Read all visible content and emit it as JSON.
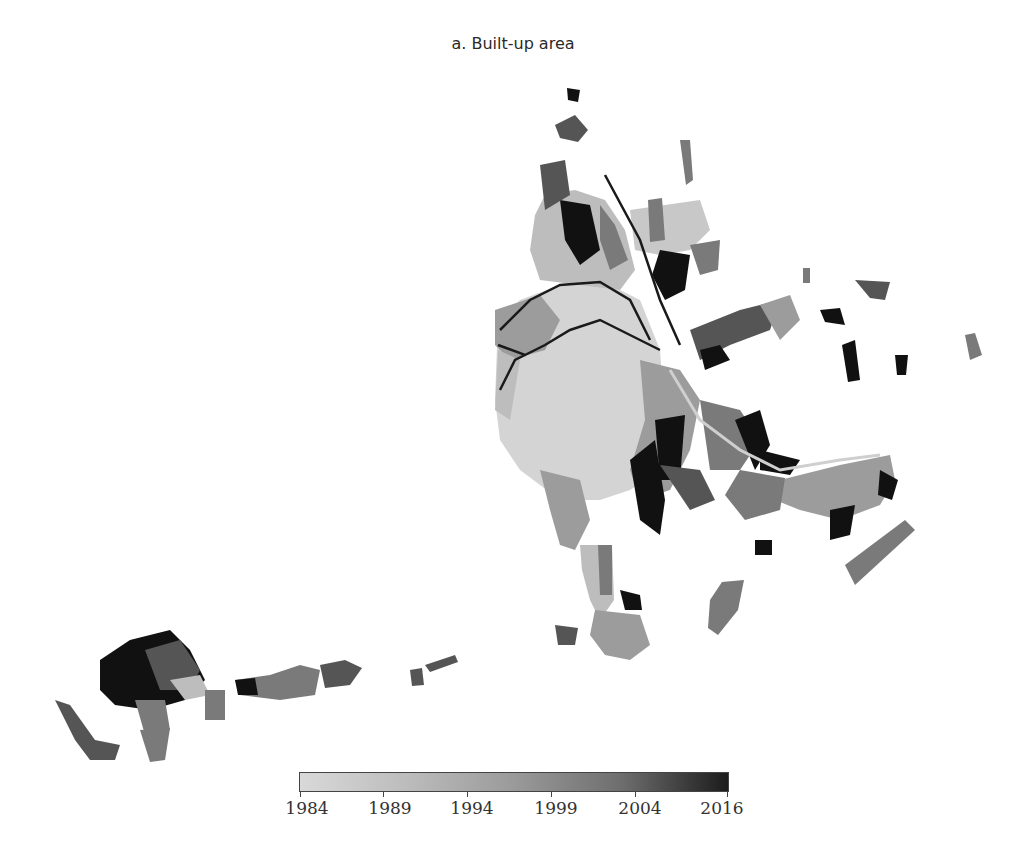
{
  "title": "a. Built-up area",
  "legend": {
    "type": "colorbar",
    "min_label": "1984",
    "max_label": "2016",
    "ticks": [
      "1984",
      "1989",
      "1994",
      "1999",
      "2004",
      "2016"
    ],
    "color_start": "#d9d9d9",
    "color_end": "#1c1c1c"
  },
  "map": {
    "subject": "Built-up area by year of urbanization",
    "palette": {
      "c1984": "#d4d4d4",
      "c1989": "#bdbdbd",
      "c1994": "#9c9c9c",
      "c1999": "#7a7a7a",
      "c2004": "#555555",
      "c2016": "#111111",
      "road": "#1a1a1a"
    }
  }
}
